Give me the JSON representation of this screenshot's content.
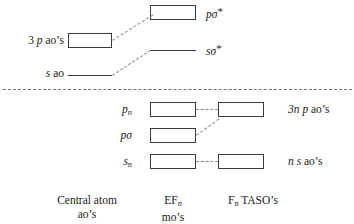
{
  "diagram": {
    "width": 354,
    "height": 224,
    "line_color": "#3a3a3a",
    "connector_color": "#8a8a8a",
    "background": "#ffffff"
  },
  "upper": {
    "central_p_label_parts": {
      "pre": "3 ",
      "italic": "p",
      "post": " ao’s"
    },
    "central_s_label_parts": {
      "italic": "s",
      "post": " ao"
    },
    "antibonding_p_label": {
      "italic": "pσ",
      "sup": "*"
    },
    "antibonding_s_label": {
      "italic": "sσ",
      "sup": "*"
    }
  },
  "lower": {
    "pn_label": {
      "italic": "p",
      "sub": "n"
    },
    "psigma_label": {
      "italic": "pσ"
    },
    "sn_label": {
      "italic": "s",
      "sub": "n"
    },
    "taso_p_label_parts": {
      "italic1": "3n",
      "space": " ",
      "italic2": "p",
      "post": " ao’s"
    },
    "taso_s_label_parts": {
      "italic1": "n",
      "space": " ",
      "italic2": "s",
      "post": " ao’s"
    }
  },
  "captions": {
    "column1_line1": "Central atom",
    "column1_line2": "ao’s",
    "column2_line1_pre": "EF",
    "column2_line1_sub": "n",
    "column2_line2": "mo’s",
    "column3_pre": "F",
    "column3_sub": "n",
    "column3_post": " TASO’s"
  }
}
